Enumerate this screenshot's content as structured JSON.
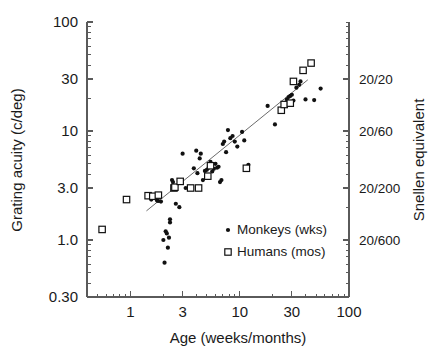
{
  "chart_data": {
    "type": "scatter",
    "title": "",
    "xlabel": "Age (weeks/months)",
    "ylabel": "Grating acuity (c/deg)",
    "y2label": "Snellen equivalent",
    "xscale": "log",
    "yscale": "log",
    "xlim": [
      0.4,
      100
    ],
    "ylim": [
      0.3,
      100
    ],
    "grid": false,
    "legend_position": "inside-lower-right",
    "xticks": [
      1,
      3,
      10,
      30,
      100
    ],
    "xticklabels": [
      "1",
      "3",
      "10",
      "30",
      "100"
    ],
    "yticks": [
      0.3,
      1.0,
      3.0,
      10,
      30,
      100
    ],
    "yticklabels": [
      "0.30",
      "1.0",
      "3.0",
      "10",
      "30",
      "100"
    ],
    "y2ticks": [
      30,
      10,
      3.0,
      1.0
    ],
    "y2ticklabels": [
      "20/20",
      "20/60",
      "20/200",
      "20/600"
    ],
    "series": [
      {
        "name": "Monkeys (wks)",
        "marker": "filled-circle",
        "color": "#111111",
        "points": [
          [
            1.55,
            2.35
          ],
          [
            1.75,
            2.3
          ],
          [
            1.8,
            2.28
          ],
          [
            1.9,
            2.25
          ],
          [
            2.0,
            1.0
          ],
          [
            2.05,
            0.62
          ],
          [
            2.1,
            1.2
          ],
          [
            2.15,
            1.15
          ],
          [
            2.2,
            0.85
          ],
          [
            2.25,
            1.05
          ],
          [
            2.3,
            1.45
          ],
          [
            2.3,
            1.55
          ],
          [
            2.4,
            3.55
          ],
          [
            2.45,
            3.4
          ],
          [
            2.55,
            3.0
          ],
          [
            2.6,
            2.15
          ],
          [
            2.8,
            2.0
          ],
          [
            3.0,
            6.2
          ],
          [
            3.2,
            3.0
          ],
          [
            3.6,
            3.05
          ],
          [
            3.8,
            4.55
          ],
          [
            4.0,
            6.6
          ],
          [
            4.1,
            4.1
          ],
          [
            4.3,
            5.6
          ],
          [
            4.4,
            6.2
          ],
          [
            4.6,
            3.55
          ],
          [
            4.8,
            4.3
          ],
          [
            5.0,
            4.4
          ],
          [
            5.2,
            4.6
          ],
          [
            5.4,
            5.2
          ],
          [
            5.6,
            4.25
          ],
          [
            5.8,
            4.5
          ],
          [
            6.0,
            5.0
          ],
          [
            6.2,
            4.6
          ],
          [
            6.4,
            4.7
          ],
          [
            6.6,
            3.4
          ],
          [
            6.8,
            3.55
          ],
          [
            7.0,
            7.6
          ],
          [
            7.2,
            8.0
          ],
          [
            7.5,
            6.4
          ],
          [
            7.8,
            10.2
          ],
          [
            8.2,
            8.6
          ],
          [
            8.6,
            9.0
          ],
          [
            9.0,
            8.0
          ],
          [
            9.5,
            7.2
          ],
          [
            10.5,
            9.8
          ],
          [
            11.0,
            8.2
          ],
          [
            12.0,
            4.9
          ],
          [
            18.0,
            17.0
          ],
          [
            21.0,
            11.5
          ],
          [
            25.0,
            17.5
          ],
          [
            26.0,
            18.0
          ],
          [
            27.0,
            19.5
          ],
          [
            28.0,
            20.5
          ],
          [
            29.0,
            21.0
          ],
          [
            30.0,
            21.5
          ],
          [
            31.0,
            19.0
          ],
          [
            33.0,
            25.0
          ],
          [
            35.0,
            26.5
          ],
          [
            36.0,
            28.5
          ],
          [
            40.0,
            19.5
          ],
          [
            48.0,
            19.2
          ],
          [
            55.0,
            24.5
          ]
        ]
      },
      {
        "name": "Humans (mos)",
        "marker": "open-square",
        "color": "#111111",
        "points": [
          [
            0.55,
            1.25
          ],
          [
            0.92,
            2.35
          ],
          [
            1.45,
            2.55
          ],
          [
            1.6,
            2.52
          ],
          [
            1.8,
            2.58
          ],
          [
            2.5,
            3.0
          ],
          [
            2.55,
            3.05
          ],
          [
            2.85,
            3.45
          ],
          [
            3.55,
            3.0
          ],
          [
            4.2,
            3.0
          ],
          [
            5.1,
            3.85
          ],
          [
            5.4,
            4.8
          ],
          [
            11.5,
            4.55
          ],
          [
            24.0,
            15.5
          ],
          [
            25.5,
            17.5
          ],
          [
            29.0,
            18.0
          ],
          [
            31.0,
            28.5
          ],
          [
            38.0,
            36.0
          ],
          [
            45.0,
            42.0
          ]
        ]
      }
    ],
    "fit_line": {
      "label": "regression",
      "x_start": 1.4,
      "y_start": 1.85,
      "x_end": 42.0,
      "y_end": 29.5,
      "color": "#6b6b6b"
    }
  },
  "legend": {
    "items": [
      {
        "label": "Monkeys (wks)",
        "marker": "filled-circle"
      },
      {
        "label": "Humans (mos)",
        "marker": "open-square"
      }
    ]
  }
}
